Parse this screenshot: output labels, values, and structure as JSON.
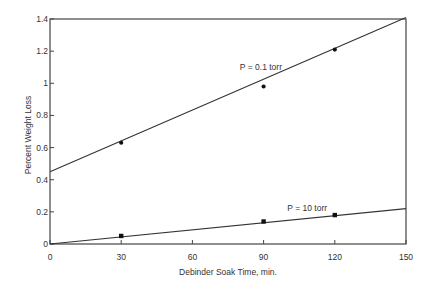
{
  "chart_data": {
    "type": "scatter",
    "title": "",
    "xlabel": "Debinder Soak Time, min.",
    "ylabel": "Percent Weight Loss",
    "xlim": [
      0,
      150
    ],
    "ylim": [
      0,
      1.4
    ],
    "x_ticks": [
      0,
      30,
      60,
      90,
      120,
      150
    ],
    "x_tick_labels": [
      "0",
      "30",
      "60",
      "90",
      "120",
      "150"
    ],
    "y_ticks": [
      0,
      0.2,
      0.4,
      0.6,
      0.8,
      1.0,
      1.2,
      1.4
    ],
    "y_tick_labels": [
      "0",
      "0.2",
      "0.4",
      "0.6",
      "0.8",
      "1",
      "1.2",
      "1.4"
    ],
    "grid": false,
    "legend": "none (inline annotations)",
    "series": [
      {
        "name": "P = 0.1 torr",
        "marker": "circle",
        "x": [
          30,
          90,
          120
        ],
        "values": [
          0.63,
          0.98,
          1.21
        ],
        "fit_line": {
          "x": [
            0,
            150
          ],
          "y": [
            0.45,
            1.41
          ]
        }
      },
      {
        "name": "P = 10 torr",
        "marker": "square",
        "x": [
          30,
          90,
          120
        ],
        "values": [
          0.05,
          0.14,
          0.18
        ],
        "fit_line": {
          "x": [
            0,
            150
          ],
          "y": [
            0.0,
            0.22
          ]
        }
      }
    ],
    "annotations": [
      {
        "text": "P = 0.1 torr",
        "x": 80,
        "y": 1.08
      },
      {
        "text": "P = 10 torr",
        "x": 100,
        "y": 0.205
      }
    ]
  },
  "colors": {
    "axis": "#444444",
    "line": "#333333",
    "marker": "#111111",
    "text": "#333333",
    "background": "#ffffff"
  }
}
